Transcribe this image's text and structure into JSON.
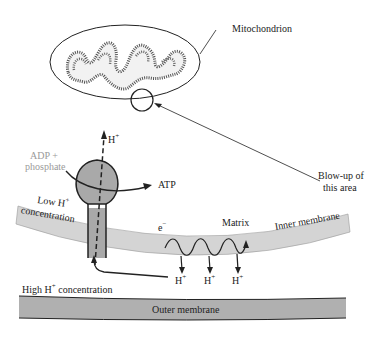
{
  "labels": {
    "mitochondrion": "Mitochondrion",
    "blowup_line1": "Blow-up of",
    "blowup_line2": "this area",
    "h_top": "H",
    "adp_line1": "ADP +",
    "adp_line2": "phosphate",
    "atp": "ATP",
    "low_line1": "Low H",
    "low_line2": "concentration",
    "electron": "e",
    "matrix": "Matrix",
    "inner_membrane": "Inner membrane",
    "h1": "H",
    "h2": "H",
    "h3": "H",
    "high": "High H",
    "high_suffix": "concentration",
    "outer_membrane": "Outer membrane",
    "plus": "+",
    "minus": "−"
  },
  "colors": {
    "membrane_fill": "#d4d4d4",
    "outer_membrane_fill": "#b0b0b0",
    "atp_synthase_fill": "#a9a9a9",
    "stroke": "#222222",
    "gray_text": "#9a9a9a"
  }
}
